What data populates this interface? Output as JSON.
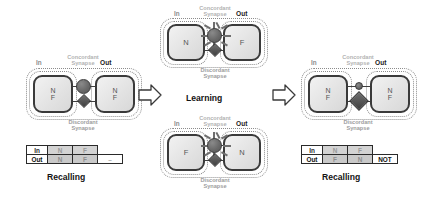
{
  "figure": {
    "background": "#ffffff"
  },
  "labels": {
    "in": "In",
    "out": "Out",
    "concordant": "Concordant\nSynapse",
    "concordant_line1": "Concordant",
    "concordant_line2": "Synapse",
    "discordant_line1": "Discordant",
    "discordant_line2": "Synapse",
    "learning": "Learning",
    "recalling": "Recalling",
    "state_n": "N",
    "state_f": "F"
  },
  "panels": {
    "left": {
      "name": "initial-state",
      "stage_label": "Recalling",
      "in_node": {
        "states": [
          "N",
          "F"
        ]
      },
      "out_node": {
        "states": [
          "N",
          "F"
        ]
      },
      "concordant_weight": "strong",
      "discordant_weight": "weak"
    },
    "middle_top": {
      "name": "learning-pair-top",
      "in_node": {
        "states": [
          "N"
        ]
      },
      "out_node": {
        "states": [
          "F"
        ]
      },
      "concordant_weight": "active",
      "discordant_weight": "weak"
    },
    "middle_bottom": {
      "name": "learning-pair-bottom",
      "in_node": {
        "states": [
          "F"
        ]
      },
      "out_node": {
        "states": [
          "N"
        ]
      },
      "concordant_weight": "active",
      "discordant_weight": "weak"
    },
    "middle_stage_label": "Learning",
    "right": {
      "name": "learned-state",
      "stage_label": "Recalling",
      "in_node": {
        "states": [
          "N",
          "F"
        ]
      },
      "out_node": {
        "states": [
          "N",
          "F"
        ]
      },
      "concordant_weight": "weak",
      "discordant_weight": "strong"
    }
  },
  "tables": {
    "left": {
      "name": "recalling-table-identity",
      "rows": [
        {
          "header": "In",
          "cells": [
            "N",
            "F"
          ],
          "note": ""
        },
        {
          "header": "Out",
          "cells": [
            "N",
            "F"
          ],
          "note": "–"
        }
      ]
    },
    "right": {
      "name": "recalling-table-not",
      "rows": [
        {
          "header": "In",
          "cells": [
            "N",
            "F"
          ],
          "note": ""
        },
        {
          "header": "Out",
          "cells": [
            "F",
            "N"
          ],
          "note": "NOT"
        }
      ]
    }
  },
  "arrows": [
    {
      "name": "arrow-left-to-learning",
      "direction": "right"
    },
    {
      "name": "arrow-learning-to-right",
      "direction": "right"
    }
  ],
  "colors": {
    "node_border": "#3a3a3a",
    "node_fill": "#e6e6e6",
    "synapse_circle": "#6a6a6a",
    "synapse_diamond": "#4e4e4e",
    "dashed_outline": "#8c8c8c",
    "label_muted": "#b2b2b2",
    "label_dark": "#111111",
    "table_shade": "#d0d0d0"
  }
}
